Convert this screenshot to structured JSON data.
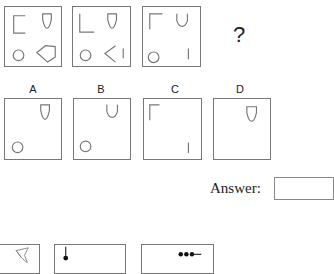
{
  "puzzle": {
    "question_mark": "?",
    "sequence_panels": [
      {
        "id": "seq-1",
        "shapes": [
          "bracket-left-open",
          "shield-cup",
          "circle",
          "hexagon"
        ]
      },
      {
        "id": "seq-2",
        "shapes": [
          "corner-bottom-left",
          "shield-cup",
          "circle",
          "chevron-left",
          "vertical-line"
        ]
      },
      {
        "id": "seq-3",
        "shapes": [
          "corner-top-left",
          "u-cup",
          "circle",
          "vertical-line"
        ]
      }
    ],
    "options": [
      {
        "label": "A",
        "shapes": [
          "shield-cup",
          "circle"
        ]
      },
      {
        "label": "B",
        "shapes": [
          "u-cup",
          "circle"
        ]
      },
      {
        "label": "C",
        "shapes": [
          "corner-top-left",
          "vertical-line"
        ]
      },
      {
        "label": "D",
        "shapes": [
          "shield-cup"
        ]
      }
    ]
  },
  "answer": {
    "label": "Answer:",
    "value": ""
  },
  "next_puzzle_preview": {
    "panels": [
      "star-shape",
      "dot-on-stick",
      "three-dots-line"
    ]
  }
}
